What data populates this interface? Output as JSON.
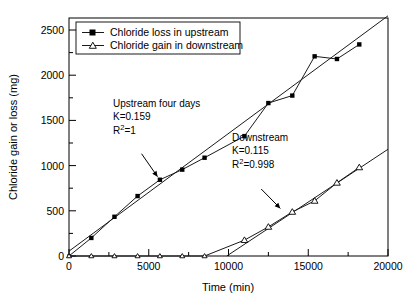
{
  "chart_data": {
    "type": "scatter",
    "title": "",
    "xlabel": "Time (min)",
    "ylabel": "Chloride gain or loss (mg)",
    "xlim": [
      0,
      20000
    ],
    "ylim": [
      0,
      2700
    ],
    "xticks": [
      0,
      5000,
      10000,
      15000,
      20000
    ],
    "xtick_labels": [
      "0",
      "5000",
      "10000",
      "15000",
      "20000"
    ],
    "yticks": [
      0,
      500,
      1000,
      1500,
      2000,
      2500
    ],
    "ytick_labels": [
      "0",
      "500",
      "1000",
      "1500",
      "2000",
      "2500"
    ],
    "minor_ticks": true,
    "grid": false,
    "legend_position": "top-left",
    "series": [
      {
        "name": "Chloride loss in upstream",
        "marker": "filled-square",
        "x": [
          0,
          1400,
          2850,
          4300,
          5700,
          7100,
          8500,
          11000,
          12500,
          14000,
          15400,
          16800,
          18200
        ],
        "y": [
          0,
          205,
          445,
          680,
          865,
          980,
          1115,
          1360,
          1735,
          1820,
          2265,
          2235,
          2400
        ],
        "fit": {
          "label": "Upstream four days",
          "K": 0.159,
          "R2": 1,
          "slope": 0.1335,
          "intercept": 55,
          "x_range": [
            0,
            20000
          ]
        }
      },
      {
        "name": "Chloride gain in downstream",
        "marker": "open-triangle",
        "x": [
          0,
          1400,
          2850,
          4300,
          5700,
          7100,
          8500,
          11000,
          12500,
          14000,
          15400,
          16800,
          18200
        ],
        "y": [
          0,
          0,
          0,
          0,
          0,
          0,
          0,
          180,
          330,
          500,
          625,
          830,
          1005
        ],
        "fit": {
          "label": "Downstream",
          "K": 0.115,
          "R2": 0.998,
          "slope": 0.1198,
          "intercept": -1185,
          "x_range": [
            9900,
            20000
          ]
        }
      }
    ],
    "annotations": [
      {
        "id": "upstream-annotation",
        "lines": [
          "Upstream four days",
          "K=0.159",
          "R2=1"
        ],
        "line3_base": "R",
        "line3_sup": "2",
        "line3_rest": "=1",
        "arrow_from": [
          4550,
          1160
        ],
        "arrow_to": [
          5550,
          900
        ]
      },
      {
        "id": "downstream-annotation",
        "lines": [
          "Downstream",
          "K=0.115",
          "R2=0.998"
        ],
        "line3_base": "R",
        "line3_sup": "2",
        "line3_rest": "=0.998",
        "arrow_from": [
          12050,
          760
        ],
        "arrow_to": [
          13250,
          540
        ]
      }
    ],
    "legend": [
      {
        "label": "Chloride loss in upstream",
        "marker": "filled-square"
      },
      {
        "label": "Chloride gain in downstream",
        "marker": "open-triangle"
      }
    ]
  },
  "colors": {
    "axis": "#000000",
    "line": "#1a1a1a",
    "marker_fill": "#000000",
    "marker_open_fill": "#ffffff",
    "background": "#ffffff"
  }
}
